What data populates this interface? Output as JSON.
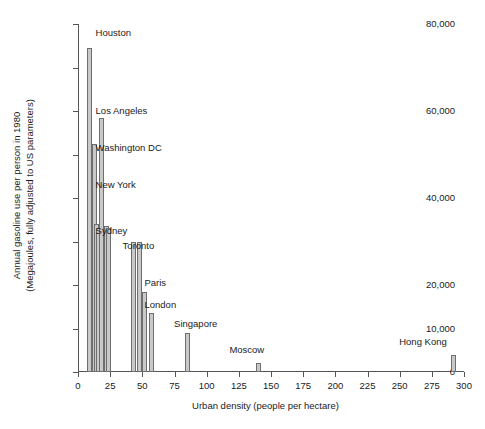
{
  "chart_data": {
    "type": "bar",
    "title": "",
    "xlabel": "Urban density (people per hectare)",
    "ylabel": "Annual gasoline use per person in 1980 (Megajoules, fully adjusted to US parameters)",
    "ylabel_line1": "Annual gasoline use per person in 1980",
    "ylabel_line2": "(Megajoules, fully adjusted to US parameters)",
    "xlim": [
      0,
      300
    ],
    "ylim": [
      0,
      80000
    ],
    "grid": false,
    "legend": "none",
    "ytick_values": [
      0,
      10000,
      20000,
      30000,
      40000,
      50000,
      60000,
      70000,
      80000
    ],
    "ytick_labels": [
      "0",
      "10,000",
      "20,000",
      "",
      "40,000",
      "",
      "60,000",
      "",
      "80,000"
    ],
    "xtick_values": [
      0,
      25,
      50,
      75,
      100,
      125,
      150,
      175,
      200,
      225,
      250,
      275,
      300
    ],
    "xtick_labels": [
      "0",
      "25",
      "50",
      "75",
      "100",
      "125",
      "150",
      "175",
      "200",
      "225",
      "250",
      "275",
      "300"
    ],
    "xlabel_text": "Urban density (people per hectare)",
    "bar_fill": "#c9c9c9",
    "bar_stroke": "#6e6e6e",
    "axis_color": "#555555",
    "text_color": "#1a1a1a",
    "points": [
      {
        "city": "Houston",
        "x": 9,
        "y": 74500,
        "labeled": true
      },
      {
        "city": "Phoenix",
        "x": 13,
        "y": 52500,
        "labeled": false
      },
      {
        "city": "Detroit",
        "x": 14,
        "y": 34000,
        "labeled": false
      },
      {
        "city": "Denver",
        "x": 16,
        "y": 33000,
        "labeled": false
      },
      {
        "city": "Los Angeles",
        "x": 18,
        "y": 58500,
        "labeled": true
      },
      {
        "city": "San Francisco",
        "x": 21,
        "y": 33000,
        "labeled": false
      },
      {
        "city": "Washington DC",
        "x": 22,
        "y": 33500,
        "labeled": true
      },
      {
        "city": "New York",
        "x": 24,
        "y": 33000,
        "labeled": true
      },
      {
        "city": "Sydney",
        "x": 43,
        "y": 30000,
        "labeled": true
      },
      {
        "city": "Toronto",
        "x": 48,
        "y": 30000,
        "labeled": true
      },
      {
        "city": "Paris",
        "x": 52,
        "y": 18500,
        "labeled": true
      },
      {
        "city": "London",
        "x": 57,
        "y": 13500,
        "labeled": true
      },
      {
        "city": "Singapore",
        "x": 85,
        "y": 9000,
        "labeled": true
      },
      {
        "city": "Moscow",
        "x": 140,
        "y": 2000,
        "labeled": false
      },
      {
        "city": "Hong Kong",
        "x": 292,
        "y": 4000,
        "labeled": false
      }
    ],
    "annotations": [
      {
        "text": "Houston",
        "x": 9,
        "y": 78000
      },
      {
        "text": "Los Angeles",
        "x": 9,
        "y": 60000
      },
      {
        "text": "Washington DC",
        "x": 9,
        "y": 51500
      },
      {
        "text": "New York",
        "x": 9,
        "y": 43000
      },
      {
        "text": "Sydney",
        "x": 9,
        "y": 32500
      },
      {
        "text": "Toronto",
        "x": 30,
        "y": 29000
      },
      {
        "text": "Paris",
        "x": 47,
        "y": 20500
      },
      {
        "text": "London",
        "x": 47,
        "y": 15500
      },
      {
        "text": "Singapore",
        "x": 70,
        "y": 11000
      },
      {
        "text": "Moscow",
        "x": 113,
        "y": 5000
      },
      {
        "text": "Hong Kong",
        "x": 245,
        "y": 7000
      }
    ]
  }
}
